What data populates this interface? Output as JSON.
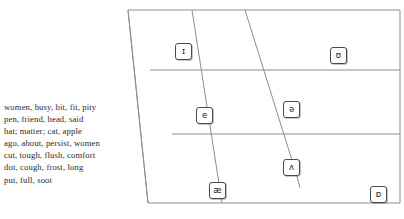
{
  "diagram": {
    "type": "ipa-vowel-quadrilateral",
    "stroke_color": "#8a8a8a",
    "text_color": "#2b2b2b"
  },
  "symbols": [
    {
      "id": "sym-i",
      "glyph": "ɪ",
      "name": "near-close near-front unrounded",
      "x": 175,
      "y": 43
    },
    {
      "id": "sym-upsilon",
      "glyph": "ʊ",
      "name": "near-close near-back rounded",
      "x": 330,
      "y": 47
    },
    {
      "id": "sym-e",
      "glyph": "e",
      "name": "close-mid front unrounded",
      "x": 196,
      "y": 107
    },
    {
      "id": "sym-schwa",
      "glyph": "ə",
      "name": "mid central",
      "x": 283,
      "y": 101
    },
    {
      "id": "sym-caret",
      "glyph": "ʌ",
      "name": "open-mid back unrounded",
      "x": 283,
      "y": 159
    },
    {
      "id": "sym-ash",
      "glyph": "æ",
      "name": "near-open front unrounded",
      "x": 209,
      "y": 182
    },
    {
      "id": "sym-openo",
      "glyph": "ɒ",
      "name": "open back rounded",
      "x": 370,
      "y": 186
    }
  ],
  "wordlist": {
    "lines": [
      {
        "words": "women, busy, bit, fit, pity",
        "vowel": "ɪ"
      },
      {
        "words": "pen, friend, head, said",
        "vowel": "e"
      },
      {
        "words": "hat; matter; cat, apple",
        "vowel": "æ"
      },
      {
        "words": "ago, about, persist, women",
        "vowel": "ə"
      },
      {
        "words": "cut, tough, flush, comfort",
        "vowel": "ʌ"
      },
      {
        "words": "dot, cough, frost, long",
        "vowel": "ɒ"
      },
      {
        "words": "put, full, soot",
        "vowel": "ʊ"
      }
    ]
  }
}
